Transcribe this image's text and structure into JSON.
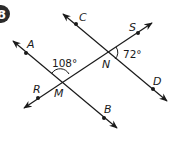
{
  "problem": {
    "number": "8",
    "badge_color": "#2b2b2b"
  },
  "diagram": {
    "points": {
      "A": {
        "label": "A"
      },
      "B": {
        "label": "B"
      },
      "C": {
        "label": "C"
      },
      "D": {
        "label": "D"
      },
      "R": {
        "label": "R"
      },
      "S": {
        "label": "S"
      },
      "M": {
        "label": "M"
      },
      "N": {
        "label": "N"
      }
    },
    "lines": [
      {
        "name": "line AB",
        "through": [
          "A",
          "M",
          "B"
        ]
      },
      {
        "name": "line CD",
        "through": [
          "C",
          "N",
          "D"
        ]
      },
      {
        "name": "line RS",
        "through": [
          "R",
          "M",
          "N",
          "S"
        ]
      }
    ],
    "angles": [
      {
        "vertex": "M",
        "label": "108°"
      },
      {
        "vertex": "N",
        "label": "72°"
      }
    ],
    "stroke_color": "#1a1a1a"
  }
}
